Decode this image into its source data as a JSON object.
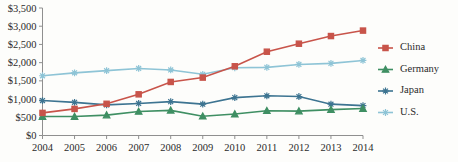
{
  "chart_data": {
    "type": "line",
    "title": "",
    "subtitle": "",
    "xlabel": "",
    "ylabel": "",
    "x": [
      2004,
      2005,
      2006,
      2007,
      2008,
      2009,
      2010,
      2011,
      2012,
      2013,
      2014
    ],
    "categories": [
      "2004",
      "2005",
      "2006",
      "2007",
      "2008",
      "2009",
      "2010",
      "2011",
      "2012",
      "2013",
      "2014"
    ],
    "ylim": [
      0,
      3500
    ],
    "ytick_values": [
      0,
      500,
      1000,
      1500,
      2000,
      2500,
      3000,
      3500
    ],
    "ytick_labels": [
      "$0",
      "$500",
      "$1,000",
      "$1,500",
      "$2,000",
      "$2,500",
      "$3,000",
      "$3,500"
    ],
    "grid": false,
    "legend_position": "right",
    "series": [
      {
        "name": "China",
        "color": "#c8544a",
        "marker": "square",
        "values": [
          620,
          730,
          870,
          1130,
          1470,
          1590,
          1900,
          2300,
          2520,
          2730,
          2880
        ]
      },
      {
        "name": "Germany",
        "color": "#3f8f63",
        "marker": "triangle",
        "values": [
          520,
          520,
          560,
          660,
          690,
          530,
          590,
          680,
          670,
          710,
          740
        ]
      },
      {
        "name": "Japan",
        "color": "#3d7491",
        "marker": "asterisk",
        "values": [
          960,
          910,
          840,
          880,
          930,
          860,
          1040,
          1090,
          1070,
          860,
          820
        ]
      },
      {
        "name": "U.S.",
        "color": "#8ec4d6",
        "marker": "asterisk",
        "values": [
          1640,
          1720,
          1780,
          1840,
          1800,
          1680,
          1860,
          1870,
          1950,
          1980,
          2060
        ]
      }
    ],
    "legend_entries": [
      {
        "label": "China",
        "color": "#c8544a",
        "marker": "square"
      },
      {
        "label": "Germany",
        "color": "#3f8f63",
        "marker": "triangle"
      },
      {
        "label": "Japan",
        "color": "#3d7491",
        "marker": "asterisk"
      },
      {
        "label": "U.S.",
        "color": "#8ec4d6",
        "marker": "asterisk"
      }
    ]
  },
  "axis": {
    "axis_color": "#8f8f8f"
  }
}
